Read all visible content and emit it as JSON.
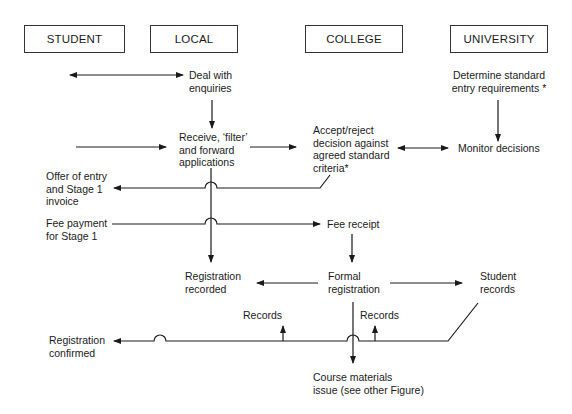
{
  "lanes": [
    {
      "id": "student",
      "label": "STUDENT"
    },
    {
      "id": "local",
      "label": "LOCAL"
    },
    {
      "id": "college",
      "label": "COLLEGE"
    },
    {
      "id": "university",
      "label": "UNIVERSITY"
    }
  ],
  "nodes": {
    "deal_with_enquiries": "Deal with\nenquiries",
    "determine_standard": "Determine standard\nentry requirements *",
    "receive_filter_forward": "Receive, ‘filter’\nand forward\napplications",
    "accept_reject": "Accept/reject\ndecision against\nagreed standard\ncriteria*",
    "monitor_decisions": "Monitor decisions",
    "offer_of_entry": "Offer of entry\nand Stage 1\ninvoice",
    "fee_payment": "Fee payment\nfor Stage 1",
    "fee_receipt": "Fee receipt",
    "registration_recorded": "Registration\nrecorded",
    "formal_registration": "Formal\nregistration",
    "student_records": "Student\nrecords",
    "records_1": "Records",
    "records_2": "Records",
    "registration_confirmed": "Registration\nconfirmed",
    "course_materials": "Course materials\nissue (see other Figure)"
  },
  "colors": {
    "line": "#1a1a1a",
    "box_border": "#333333",
    "background": "#ffffff"
  }
}
